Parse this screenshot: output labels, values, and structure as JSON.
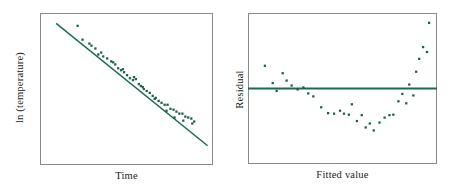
{
  "figure": {
    "background": "#ffffff",
    "accent_color": "#176b55",
    "frame_color": "#8a8a8a",
    "point_color": "#1d5f4d"
  },
  "panels": [
    {
      "id": "left",
      "name": "log-temperature-vs-time-scatter",
      "xlabel": "Time",
      "ylabel": "ln (temperature)"
    },
    {
      "id": "right",
      "name": "residual-vs-fitted-value-plot",
      "xlabel": "Fitted value",
      "ylabel": "Residual"
    }
  ],
  "chart_data": [
    {
      "type": "scatter",
      "title": "",
      "xlabel": "Time",
      "ylabel": "ln (temperature)",
      "xlim": [
        0,
        100
      ],
      "ylim": [
        0,
        100
      ],
      "grid": false,
      "legend": false,
      "series": [
        {
          "name": "observations",
          "marker": "square",
          "color": "#1d5f4d",
          "points": [
            [
              21.4,
              92.1
            ],
            [
              24.3,
              82.9
            ],
            [
              28.3,
              80.3
            ],
            [
              31.8,
              77.0
            ],
            [
              33.5,
              73.0
            ],
            [
              36.4,
              71.7
            ],
            [
              38.7,
              70.4
            ],
            [
              41.0,
              68.4
            ],
            [
              43.4,
              66.4
            ],
            [
              45.1,
              63.8
            ],
            [
              46.8,
              62.5
            ],
            [
              48.6,
              61.2
            ],
            [
              50.3,
              59.2
            ],
            [
              52.0,
              57.2
            ],
            [
              53.8,
              55.9
            ],
            [
              55.5,
              56.6
            ],
            [
              57.2,
              53.3
            ],
            [
              58.4,
              52.0
            ],
            [
              60.1,
              50.0
            ],
            [
              61.8,
              48.7
            ],
            [
              63.6,
              47.4
            ],
            [
              65.3,
              45.4
            ],
            [
              67.1,
              44.1
            ],
            [
              68.8,
              42.1
            ],
            [
              70.5,
              40.8
            ],
            [
              72.3,
              39.5
            ],
            [
              74.0,
              39.5
            ],
            [
              75.7,
              36.8
            ],
            [
              77.5,
              36.2
            ],
            [
              79.2,
              34.9
            ],
            [
              80.9,
              33.6
            ],
            [
              82.7,
              33.6
            ],
            [
              84.4,
              31.6
            ],
            [
              86.1,
              31.0
            ],
            [
              87.9,
              30.3
            ],
            [
              89.6,
              28.3
            ],
            [
              88.5,
              27.0
            ],
            [
              83.2,
              28.9
            ],
            [
              78.1,
              31.0
            ],
            [
              73.4,
              35.5
            ],
            [
              66.5,
              43.4
            ],
            [
              59.5,
              51.3
            ],
            [
              54.4,
              57.9
            ],
            [
              47.9,
              63.2
            ],
            [
              42.2,
              67.8
            ],
            [
              35.2,
              74.3
            ],
            [
              29.5,
              78.9
            ]
          ]
        }
      ],
      "fit_line": {
        "name": "least-squares-fit",
        "color": "#176b55",
        "x0": 9.2,
        "y0": 93.4,
        "x1": 97.1,
        "y1": 12.5
      },
      "description": "Nearly linear decreasing relationship with slight systematic curvature about the fitted straight line."
    },
    {
      "type": "scatter",
      "title": "",
      "xlabel": "Fitted value",
      "ylabel": "Residual",
      "xlim": [
        0,
        100
      ],
      "ylim": [
        -100,
        100
      ],
      "grid": false,
      "legend": false,
      "series": [
        {
          "name": "residuals",
          "marker": "square",
          "color": "#1d5f4d",
          "points": [
            [
              8.5,
              30.5
            ],
            [
              12.7,
              7.3
            ],
            [
              14.8,
              -3.3
            ],
            [
              18.0,
              20.5
            ],
            [
              20.1,
              10.6
            ],
            [
              22.8,
              4.0
            ],
            [
              26.0,
              -1.3
            ],
            [
              29.1,
              1.4
            ],
            [
              31.7,
              -6.6
            ],
            [
              34.4,
              -10.6
            ],
            [
              38.6,
              -25.2
            ],
            [
              42.3,
              -33.1
            ],
            [
              45.5,
              -33.8
            ],
            [
              48.7,
              -29.8
            ],
            [
              50.8,
              -33.8
            ],
            [
              53.4,
              -35.1
            ],
            [
              55.0,
              -21.2
            ],
            [
              57.7,
              -43.7
            ],
            [
              60.3,
              -35.8
            ],
            [
              62.4,
              -52.3
            ],
            [
              64.6,
              -47.0
            ],
            [
              66.7,
              -56.3
            ],
            [
              69.8,
              -45.7
            ],
            [
              72.5,
              -39.1
            ],
            [
              75.1,
              -35.8
            ],
            [
              77.2,
              -35.1
            ],
            [
              79.9,
              -17.2
            ],
            [
              82.0,
              -7.3
            ],
            [
              84.1,
              -19.9
            ],
            [
              85.7,
              5.3
            ],
            [
              87.9,
              -9.3
            ],
            [
              89.4,
              22.5
            ],
            [
              91.0,
              39.8
            ],
            [
              93.1,
              55.6
            ],
            [
              95.2,
              49.0
            ],
            [
              96.3,
              88.1
            ]
          ]
        }
      ],
      "zero_line": {
        "name": "zero-residual-line",
        "color": "#176b55",
        "y": 0
      },
      "description": "Residuals show a clear U-shaped (quadratic) pattern about the zero line, indicating the straight-line model is inadequate."
    }
  ]
}
